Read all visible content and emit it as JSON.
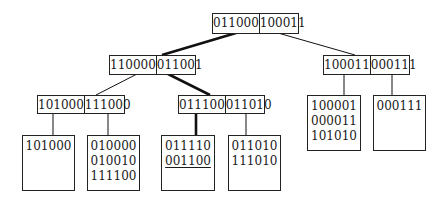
{
  "diagram": {
    "type": "tree",
    "root": {
      "keys": [
        "011000",
        "100011"
      ]
    },
    "level2": [
      {
        "id": "L",
        "keys": [
          "110000",
          "011001"
        ]
      },
      {
        "id": "R",
        "keys": [
          "100011",
          "000111"
        ]
      }
    ],
    "level3": [
      {
        "id": "LL",
        "keys": [
          "101000",
          "111000"
        ]
      },
      {
        "id": "LR",
        "keys": [
          "011100",
          "011010"
        ]
      }
    ],
    "leaves": [
      {
        "id": "LLa",
        "entries": [
          "101000"
        ]
      },
      {
        "id": "LLb",
        "entries": [
          "010000",
          "010010",
          "111100"
        ]
      },
      {
        "id": "LRa",
        "entries": [
          "011110",
          "001100"
        ],
        "underlined": "001100"
      },
      {
        "id": "LRb",
        "entries": [
          "011010",
          "111010"
        ]
      },
      {
        "id": "Ra",
        "entries": [
          "100001",
          "000011",
          "101010"
        ]
      },
      {
        "id": "Rb",
        "entries": [
          "000111"
        ]
      }
    ],
    "highlighted_path": [
      "root",
      "L",
      "LR",
      "LRa"
    ]
  }
}
